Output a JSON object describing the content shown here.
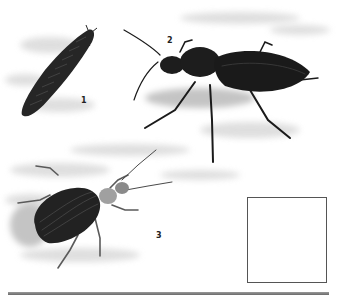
{
  "illustration": {
    "subject": "Ground beetles (Carabidae) natural history plate",
    "labels": [
      "1",
      "2",
      "3"
    ],
    "figures": [
      {
        "id": "1",
        "description": "Beetle larva"
      },
      {
        "id": "2",
        "description": "Long-legged black ground beetle"
      },
      {
        "id": "3",
        "description": "Ground beetle with dark ribbed elytra"
      }
    ],
    "colors": {
      "ink": "#1a1a1a",
      "ground_shadow": "#cfcfcf",
      "elytra_dark": "#202020",
      "pronotum_light": "#9a9a9a",
      "rule": "#7a7a7a"
    }
  },
  "map": {
    "title": "Distribution map of Europe",
    "marker_count": 10,
    "open_marker_count": 1
  }
}
